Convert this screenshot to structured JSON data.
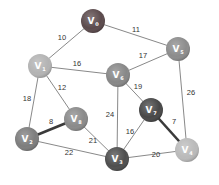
{
  "diagram": {
    "type": "weighted-undirected-graph",
    "nodes": [
      {
        "id": "V0",
        "label": "V",
        "sub": "0",
        "x": 93,
        "y": 21,
        "color": "#5b4a4c"
      },
      {
        "id": "V1",
        "label": "V",
        "sub": "1",
        "x": 40,
        "y": 66,
        "color": "#b3b3b3"
      },
      {
        "id": "V2",
        "label": "V",
        "sub": "2",
        "x": 27,
        "y": 139,
        "color": "#7d7d7d"
      },
      {
        "id": "V3",
        "label": "V",
        "sub": "3",
        "x": 117,
        "y": 159,
        "color": "#4e4e4e"
      },
      {
        "id": "V4",
        "label": "V",
        "sub": "4",
        "x": 187,
        "y": 150,
        "color": "#bababa"
      },
      {
        "id": "V5",
        "label": "V",
        "sub": "5",
        "x": 178,
        "y": 49,
        "color": "#8c8c8c"
      },
      {
        "id": "V6",
        "label": "V",
        "sub": "6",
        "x": 118,
        "y": 75,
        "color": "#878787"
      },
      {
        "id": "V7",
        "label": "V",
        "sub": "7",
        "x": 151,
        "y": 110,
        "color": "#474747"
      },
      {
        "id": "V8",
        "label": "V",
        "sub": "8",
        "x": 76,
        "y": 119,
        "color": "#8a8a8a"
      }
    ],
    "edges": [
      {
        "from": "V0",
        "to": "V1",
        "weight": "10",
        "lx": 62,
        "ly": 40,
        "thick": false
      },
      {
        "from": "V0",
        "to": "V5",
        "weight": "11",
        "lx": 136,
        "ly": 32,
        "thick": false
      },
      {
        "from": "V1",
        "to": "V6",
        "weight": "16",
        "lx": 77,
        "ly": 66,
        "thick": false
      },
      {
        "from": "V5",
        "to": "V6",
        "weight": "17",
        "lx": 143,
        "ly": 58,
        "thick": false
      },
      {
        "from": "V1",
        "to": "V8",
        "weight": "12",
        "lx": 62,
        "ly": 90,
        "thick": false
      },
      {
        "from": "V1",
        "to": "V2",
        "weight": "18",
        "lx": 27,
        "ly": 101,
        "thick": false
      },
      {
        "from": "V6",
        "to": "V7",
        "weight": "19",
        "lx": 138,
        "ly": 89,
        "thick": false
      },
      {
        "from": "V6",
        "to": "V3",
        "weight": "24",
        "lx": 110,
        "ly": 117,
        "thick": false
      },
      {
        "from": "V5",
        "to": "V4",
        "weight": "26",
        "lx": 191,
        "ly": 95,
        "thick": false
      },
      {
        "from": "V2",
        "to": "V8",
        "weight": "8",
        "lx": 51,
        "ly": 124,
        "thick": true
      },
      {
        "from": "V7",
        "to": "V4",
        "weight": "7",
        "lx": 174,
        "ly": 124,
        "thick": true
      },
      {
        "from": "V8",
        "to": "V3",
        "weight": "21",
        "lx": 93,
        "ly": 143,
        "thick": false
      },
      {
        "from": "V2",
        "to": "V3",
        "weight": "22",
        "lx": 69,
        "ly": 155,
        "thick": false
      },
      {
        "from": "V7",
        "to": "V3",
        "weight": "16",
        "lx": 130,
        "ly": 134,
        "thick": false
      },
      {
        "from": "V3",
        "to": "V4",
        "weight": "20",
        "lx": 156,
        "ly": 157,
        "thick": false
      }
    ],
    "style": {
      "node_radius": 12,
      "edge_color": "#6a6a6a",
      "thick_edge_color": "#3a3a3a",
      "background": "#ffffff"
    }
  }
}
